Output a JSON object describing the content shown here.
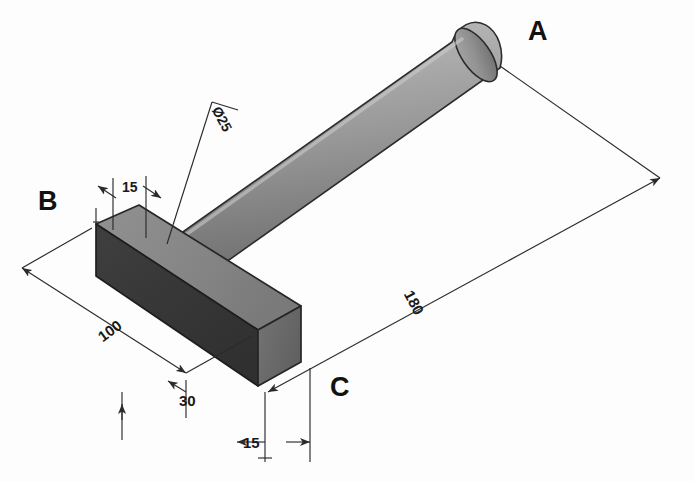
{
  "drawing": {
    "title": "Isometric assembly of cylindrical rod and rectangular block",
    "background_color": "#fdfdfd",
    "line_color": "#2b2b2b"
  },
  "point_labels": [
    {
      "name": "A",
      "text": "A",
      "x": 528,
      "y": 18,
      "description": "free end of cylindrical rod"
    },
    {
      "name": "B",
      "text": "B",
      "x": 38,
      "y": 188,
      "description": "far top corner of block"
    },
    {
      "name": "C",
      "text": "C",
      "x": 330,
      "y": 374,
      "description": "near bottom corner of block"
    }
  ],
  "dimensions": [
    {
      "name": "diameter-25",
      "text": "Ø25",
      "value": 25,
      "symbol": "Ø",
      "x": 222,
      "y": 104,
      "rotation": 62,
      "feature": "rod diameter"
    },
    {
      "name": "height-15-top",
      "text": "15",
      "value": 15,
      "x": 122,
      "y": 180,
      "rotation": 0,
      "feature": "block thickness at B"
    },
    {
      "name": "length-180",
      "text": "180",
      "value": 180,
      "x": 415,
      "y": 288,
      "rotation": 62,
      "feature": "overall rod length"
    },
    {
      "name": "length-100",
      "text": "100",
      "value": 100,
      "x": 95,
      "y": 332,
      "rotation": -36,
      "feature": "block length"
    },
    {
      "name": "depth-30",
      "text": "30",
      "value": 30,
      "x": 179,
      "y": 393,
      "rotation": 0,
      "feature": "block depth"
    },
    {
      "name": "width-15-bottom",
      "text": "15",
      "value": 15,
      "x": 243,
      "y": 435,
      "rotation": 0,
      "feature": "block width at C"
    }
  ],
  "solids": {
    "rod": {
      "name": "cylindrical-rod",
      "shade_top": "#b9b9b9",
      "shade_bottom": "#6f6f6f",
      "cap": "#8d8d8d"
    },
    "block": {
      "name": "rectangular-block",
      "face_top": "#8a8a8a",
      "face_front": "#3a3a3a",
      "face_end": "#6a6a6a"
    }
  }
}
